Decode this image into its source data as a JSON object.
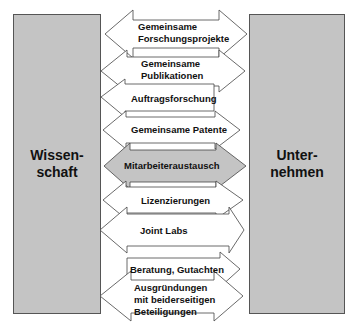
{
  "diagram": {
    "left_box": {
      "label": "Wissen-\nschaft"
    },
    "right_box": {
      "label": "Unter-\nnehmen"
    },
    "colors": {
      "box_fill": "#c4c4c4",
      "arrow_fill": "#ffffff",
      "highlight_fill": "#c4c4c4",
      "stroke": "#444444"
    },
    "arrows": [
      {
        "label": "Gemeinsame\nForschungsprojekte",
        "direction": "both"
      },
      {
        "label": "Gemeinsame\nPublikationen",
        "direction": "both"
      },
      {
        "label": "Auftragsforschung",
        "direction": "left"
      },
      {
        "label": "Gemeinsame Patente",
        "direction": "both"
      },
      {
        "label": "Mitarbeiteraustausch",
        "direction": "both",
        "highlighted": true
      },
      {
        "label": "Lizenzierungen",
        "direction": "both"
      },
      {
        "label": "Joint Labs",
        "direction": "both"
      },
      {
        "label": "Beratung, Gutachten",
        "direction": "right"
      },
      {
        "label": "Ausgründungen\nmit beiderseitigen\nBeteiligungen",
        "direction": "both"
      }
    ]
  }
}
